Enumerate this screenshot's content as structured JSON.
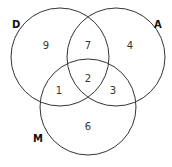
{
  "diagram": {
    "type": "venn-3",
    "sets": [
      {
        "id": "D",
        "label": "D",
        "cx": 60,
        "cy": 57,
        "r": 49,
        "label_x": 12,
        "label_y": 28
      },
      {
        "id": "A",
        "label": "A",
        "cx": 116,
        "cy": 57,
        "r": 49,
        "label_x": 154,
        "label_y": 28
      },
      {
        "id": "M",
        "label": "M",
        "cx": 88,
        "cy": 107,
        "r": 48,
        "label_x": 33,
        "label_y": 142
      }
    ],
    "regions": [
      {
        "sets": "D only",
        "value": "9",
        "x": 46,
        "y": 46
      },
      {
        "sets": "D∩A",
        "value": "7",
        "x": 88,
        "y": 46
      },
      {
        "sets": "A only",
        "value": "4",
        "x": 130,
        "y": 46
      },
      {
        "sets": "D∩A∩M",
        "value": "2",
        "x": 88,
        "y": 79
      },
      {
        "sets": "D∩M",
        "value": "1",
        "x": 59,
        "y": 91
      },
      {
        "sets": "A∩M",
        "value": "3",
        "x": 113,
        "y": 91
      },
      {
        "sets": "M only",
        "value": "6",
        "x": 88,
        "y": 127
      }
    ]
  }
}
